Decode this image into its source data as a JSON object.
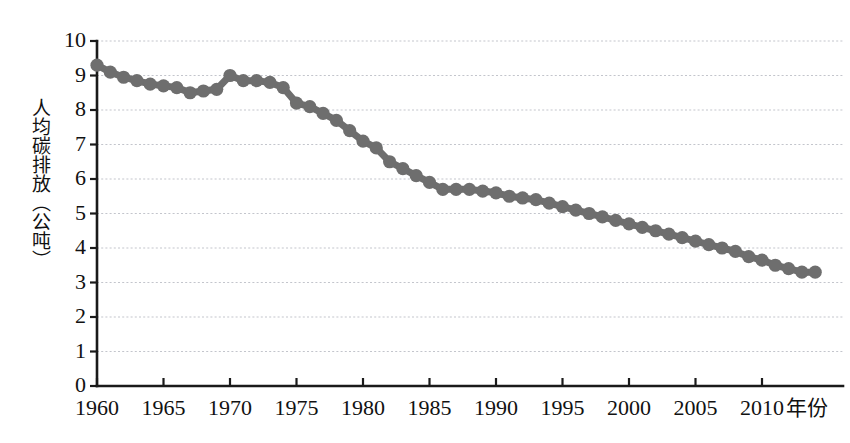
{
  "chart_data": {
    "type": "scatter",
    "title": "",
    "subtitle": "",
    "xlabel": "年份",
    "ylabel": "人均碳排放（公吨）",
    "xlim": [
      1959,
      1959
    ],
    "ylim": [
      0,
      10
    ],
    "grid": true,
    "legend": null,
    "marker_color": "#6e6e6e",
    "axis_color": "#1a1a1a",
    "grid_color": "#b9bcc4",
    "background": "#ffffff",
    "y_ticks": [
      0,
      1,
      2,
      3,
      4,
      5,
      6,
      7,
      8,
      9,
      10
    ],
    "y_tick_labels": [
      "0",
      "1",
      "2",
      "3",
      "4",
      "5",
      "6",
      "7",
      "8",
      "9",
      "10"
    ],
    "x_ticks": [
      1960,
      1965,
      1970,
      1975,
      1980,
      1985,
      1990,
      1995,
      2000,
      2005,
      2010
    ],
    "x_tick_labels": [
      "1960",
      "1965",
      "1970",
      "1975",
      "1980",
      "1985",
      "1990",
      "1995",
      "2000",
      "2005",
      "2010"
    ],
    "x": [
      1960,
      1961,
      1962,
      1963,
      1964,
      1965,
      1966,
      1967,
      1968,
      1969,
      1970,
      1971,
      1972,
      1973,
      1974,
      1975,
      1976,
      1977,
      1978,
      1979,
      1980,
      1981,
      1982,
      1983,
      1984,
      1985,
      1986,
      1987,
      1988,
      1989,
      1990,
      1991,
      1992,
      1993,
      1994,
      1995,
      1996,
      1997,
      1998,
      1999,
      2000,
      2001,
      2002,
      2003,
      2004,
      2005,
      2006,
      2007,
      2008,
      2009,
      2010,
      2011,
      2012,
      2013,
      2014
    ],
    "values": [
      9.3,
      9.1,
      8.95,
      8.85,
      8.75,
      8.7,
      8.65,
      8.5,
      8.55,
      8.6,
      9.0,
      8.85,
      8.85,
      8.8,
      8.65,
      8.2,
      8.1,
      7.9,
      7.7,
      7.4,
      7.1,
      6.9,
      6.5,
      6.3,
      6.1,
      5.9,
      5.7,
      5.7,
      5.7,
      5.65,
      5.6,
      5.5,
      5.45,
      5.4,
      5.3,
      5.2,
      5.1,
      5.0,
      4.9,
      4.8,
      4.7,
      4.6,
      4.5,
      4.4,
      4.3,
      4.2,
      4.1,
      4.0,
      3.9,
      3.75,
      3.65,
      3.5,
      3.4,
      3.3,
      3.3
    ]
  },
  "axis": {
    "y_title": "人均碳排放（公吨）",
    "x_title": "年份"
  }
}
